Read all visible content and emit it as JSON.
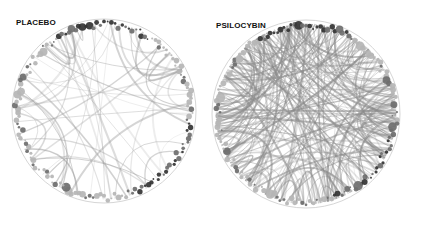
{
  "panels": [
    {
      "label": "PLACEBO",
      "center": [
        104,
        111
      ],
      "radius": 92,
      "node_count": 150,
      "edge_count": 55,
      "edge_color": "#9a9a9a",
      "edge_opacity": 0.45,
      "seed": 7
    },
    {
      "label": "PSILOCYBIN",
      "center": [
        306,
        114
      ],
      "radius": 94,
      "node_count": 150,
      "edge_count": 230,
      "edge_color": "#8a8a8a",
      "edge_opacity": 0.5,
      "seed": 13
    }
  ],
  "colors": {
    "dark_node": "#333333",
    "mid_node": "#6e6e6e",
    "light_node": "#b5b5b5",
    "ring": "#d6d6d6"
  }
}
